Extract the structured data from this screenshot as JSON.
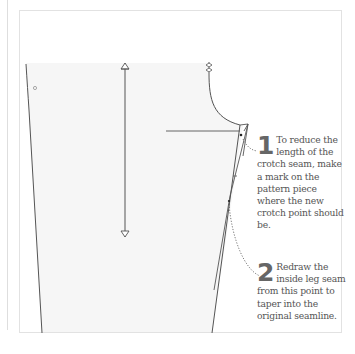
{
  "diagram": {
    "colors": {
      "line": "#555555",
      "fill": "#f7f7f7",
      "frame": "#e2e2e2",
      "text": "#555555"
    },
    "steps": [
      {
        "number": "1",
        "text": "To reduce the length of the crotch seam, make a mark on the pattern piece where the new crotch point should be."
      },
      {
        "number": "2",
        "text": "Redraw the inside leg seam from this point to taper into the original seamline."
      }
    ],
    "elements": [
      "grainline-arrow",
      "double-notch",
      "circle-mark",
      "crotch-point-mark",
      "inside-leg-seam",
      "new-seamline",
      "dotted-leader"
    ]
  }
}
